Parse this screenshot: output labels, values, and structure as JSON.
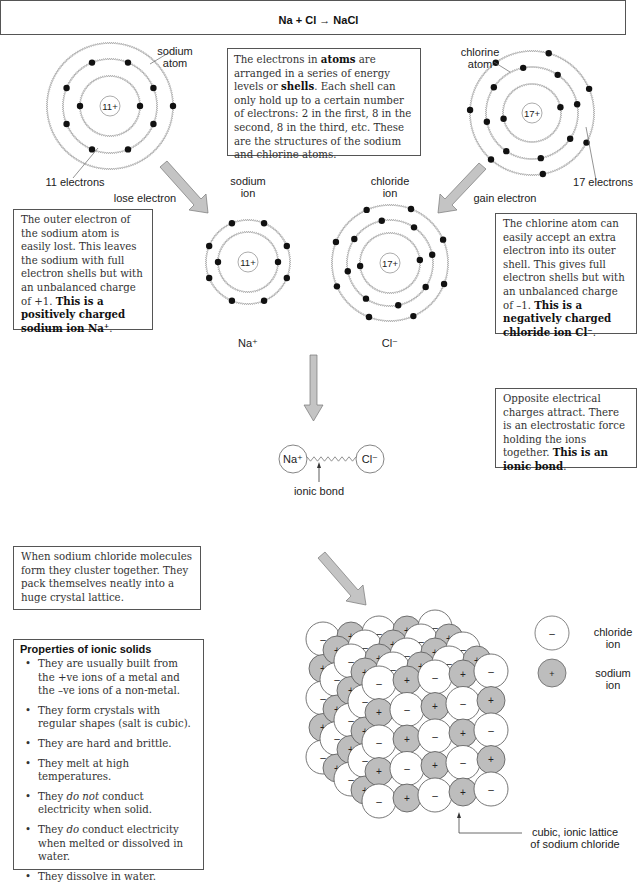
{
  "header": {
    "equation": "Na + Cl → NaCl"
  },
  "atoms": {
    "sodium_atom": {
      "label_line1": "sodium",
      "label_line2": "atom",
      "nucleus": "11+",
      "electrons_label": "11 electrons",
      "center": [
        110,
        106
      ],
      "shells": [
        30,
        47,
        63
      ]
    },
    "chlorine_atom": {
      "label_line1": "chlorine",
      "label_line2": "atom",
      "nucleus": "17+",
      "electrons_label": "17 electrons",
      "center": [
        532,
        113
      ],
      "shells": [
        29,
        46,
        62
      ]
    },
    "sodium_ion": {
      "label_line1": "sodium",
      "label_line2": "ion",
      "nucleus": "11+",
      "symbol": "Na⁺",
      "center": [
        248,
        262
      ],
      "shells": [
        30,
        42
      ]
    },
    "chloride_ion": {
      "label_line1": "chloride",
      "label_line2": "ion",
      "nucleus": "17+",
      "symbol": "Cl⁻",
      "center": [
        390,
        263
      ],
      "shells": [
        30,
        43,
        58
      ]
    }
  },
  "arrows": {
    "lose_electron": "lose electron",
    "gain_electron": "gain electron"
  },
  "text_boxes": {
    "shells_intro": {
      "parts": [
        {
          "t": "The electrons in "
        },
        {
          "t": "atoms",
          "b": true
        },
        {
          "t": " are arranged in a series of energy levels or "
        },
        {
          "t": "shells",
          "b": true
        },
        {
          "t": ". Each shell can only hold up to a certain number of electrons: 2 in the first, 8 in the second, 8 in the third, etc. These are the structures of the sodium and chlorine atoms."
        }
      ]
    },
    "sodium_explain": {
      "parts": [
        {
          "t": "The outer electron of the sodium atom is easily lost. This leaves the sodium with full electron shells but with an unbalanced charge of +1. "
        },
        {
          "t": "This is a positively charged sodium ion Na⁺",
          "b": true
        },
        {
          "t": "."
        }
      ]
    },
    "chlorine_explain": {
      "parts": [
        {
          "t": "The chlorine atom can easily accept an extra electron into its outer shell. This gives full electron shells but with an unbalanced charge of –1. "
        },
        {
          "t": "This is a negatively charged chloride ion Cl⁻",
          "b": true
        },
        {
          "t": "."
        }
      ]
    },
    "bond_explain": {
      "parts": [
        {
          "t": "Opposite electrical charges attract. There is an electrostatic force holding the ions together. "
        },
        {
          "t": "This is an ionic bond",
          "b": true
        },
        {
          "t": "."
        }
      ]
    },
    "lattice_explain": {
      "parts": [
        {
          "t": "When sodium chloride molecules form they cluster together. They pack themselves neatly into a huge crystal lattice."
        }
      ]
    }
  },
  "bond": {
    "left": "Na⁺",
    "right": "Cl⁻",
    "label": "ionic bond"
  },
  "properties": {
    "title": "Properties of ionic solids",
    "items": [
      [
        {
          "t": "They are usually built from the +ve ions of a metal and the –ve ions of a non-metal."
        }
      ],
      [
        {
          "t": "They form crystals with regular shapes (salt is cubic)."
        }
      ],
      [
        {
          "t": "They are hard and brittle."
        }
      ],
      [
        {
          "t": "They melt at high temperatures."
        }
      ],
      [
        {
          "t": "They "
        },
        {
          "t": "do not",
          "i": true
        },
        {
          "t": " conduct electricity when solid."
        }
      ],
      [
        {
          "t": "They "
        },
        {
          "t": "do",
          "i": true
        },
        {
          "t": " conduct electricity when melted or dissolved in water."
        }
      ],
      [
        {
          "t": "They dissolve in water."
        }
      ]
    ]
  },
  "lattice": {
    "label_line1": "cubic, ionic lattice",
    "label_line2": "of sodium chloride",
    "front_origin": [
      379,
      683
    ],
    "col_step": [
      28,
      -3
    ],
    "row_step": [
      0,
      29.5
    ],
    "layer_step": [
      -14,
      -11
    ],
    "layers": 5,
    "size": 5,
    "chloride_radius": 17,
    "sodium_radius": 14
  },
  "legend": {
    "chloride": {
      "label_line1": "chloride",
      "label_line2": "ion",
      "sign": "–"
    },
    "sodium": {
      "label_line1": "sodium",
      "label_line2": "ion",
      "sign": "+"
    }
  },
  "colors": {
    "sodium_fill": "#bdbdbd",
    "chloride_fill": "#ffffff",
    "arrow_fill": "#c4c4c4",
    "stroke": "#555555"
  }
}
